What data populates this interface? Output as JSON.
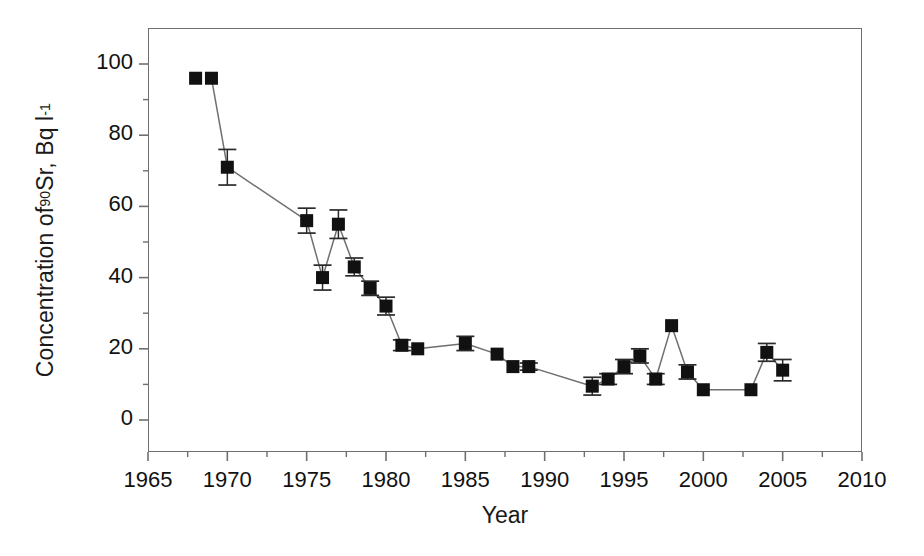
{
  "chart_data": {
    "type": "scatter",
    "title": "",
    "xlabel": "Year",
    "ylabel_html": "Concentration of <sup>90</sup>Sr, Bq l<sup>-1</sup>",
    "ylabel_text": "Concentration of 90Sr, Bq l-1",
    "xlim": [
      1965,
      2010
    ],
    "ylim": [
      0,
      100
    ],
    "xticks": [
      1965,
      1970,
      1975,
      1980,
      1985,
      1990,
      1995,
      2000,
      2005,
      2010
    ],
    "yticks": [
      0,
      20,
      40,
      60,
      80,
      100
    ],
    "xtick_labels": [
      "1965",
      "1970",
      "1975",
      "1980",
      "1985",
      "1990",
      "1995",
      "2000",
      "2005",
      "2010"
    ],
    "ytick_labels": [
      "0",
      "20",
      "40",
      "60",
      "80",
      "100"
    ],
    "x_minor_interval": 2.5,
    "y_minor_interval": 10,
    "grid": false,
    "legend": false,
    "marker": "filled-square",
    "marker_color": "#111111",
    "line_color": "#6f6f6f",
    "errorbar_color": "#2a2a2a",
    "series": [
      {
        "name": "90Sr concentration",
        "connected": true,
        "points": [
          {
            "x": 1968,
            "y": 96,
            "err": 0,
            "connected_to_next": false
          },
          {
            "x": 1969,
            "y": 96,
            "err": 0
          },
          {
            "x": 1970,
            "y": 71,
            "err": 5
          },
          {
            "x": 1975,
            "y": 56,
            "err": 3.5
          },
          {
            "x": 1976,
            "y": 40,
            "err": 3.5
          },
          {
            "x": 1977,
            "y": 55,
            "err": 4
          },
          {
            "x": 1978,
            "y": 43,
            "err": 2.5
          },
          {
            "x": 1979,
            "y": 37,
            "err": 2
          },
          {
            "x": 1980,
            "y": 32,
            "err": 2.5
          },
          {
            "x": 1981,
            "y": 21,
            "err": 1.5
          },
          {
            "x": 1982,
            "y": 20,
            "err": 0
          },
          {
            "x": 1985,
            "y": 21.5,
            "err": 2
          },
          {
            "x": 1987,
            "y": 18.5,
            "err": 0
          },
          {
            "x": 1988,
            "y": 15,
            "err": 0
          },
          {
            "x": 1989,
            "y": 15,
            "err": 1
          },
          {
            "x": 1993,
            "y": 9.5,
            "err": 2.5
          },
          {
            "x": 1994,
            "y": 11.5,
            "err": 1.5
          },
          {
            "x": 1995,
            "y": 15,
            "err": 2
          },
          {
            "x": 1996,
            "y": 18,
            "err": 2
          },
          {
            "x": 1997,
            "y": 11.5,
            "err": 1.5
          },
          {
            "x": 1998,
            "y": 26.5,
            "err": 0
          },
          {
            "x": 1999,
            "y": 13.5,
            "err": 2
          },
          {
            "x": 2000,
            "y": 8.5,
            "err": 0
          },
          {
            "x": 2003,
            "y": 8.5,
            "err": 0
          },
          {
            "x": 2004,
            "y": 19,
            "err": 2.5
          },
          {
            "x": 2005,
            "y": 14,
            "err": 3
          }
        ]
      }
    ]
  },
  "axes": {
    "x_axis_name": "Year",
    "y_axis_name": "Concentration of 90Sr, Bq l-1"
  }
}
